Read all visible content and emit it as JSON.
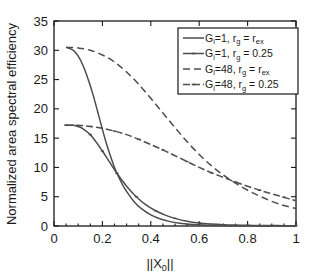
{
  "chart_data": {
    "type": "line",
    "title": "",
    "xlabel": "||X_0||",
    "xlabel_main": "||X",
    "xlabel_sub": "0",
    "xlabel_tail": "||",
    "ylabel": "Normalized area spectral efficiency",
    "xlim": [
      0,
      1
    ],
    "ylim": [
      0,
      35
    ],
    "xticks": [
      "0",
      "0.2",
      "0.4",
      "0.6",
      "0.8",
      "1"
    ],
    "xtick_values": [
      0,
      0.2,
      0.4,
      0.6,
      0.8,
      1
    ],
    "yticks": [
      "0",
      "5",
      "10",
      "15",
      "20",
      "25",
      "30",
      "35"
    ],
    "ytick_values": [
      0,
      5,
      10,
      15,
      20,
      25,
      30,
      35
    ],
    "grid": false,
    "legend_position": "upper right",
    "series": [
      {
        "name": "G_i=1, r_g = r_ex",
        "label_parts": {
          "g": "G",
          "gsub": "i",
          "mid": "=1, r",
          "rsub": "g",
          "eq": " = r",
          "tailsub": "ex"
        },
        "style": "solid",
        "marker": "none",
        "color": "#4d4d4d",
        "x": [
          0.05,
          0.08,
          0.1,
          0.12,
          0.14,
          0.16,
          0.18,
          0.2,
          0.22,
          0.25,
          0.28,
          0.3,
          0.33,
          0.36,
          0.4,
          0.44,
          0.48,
          0.52,
          0.56,
          0.6,
          0.65,
          0.7,
          0.75,
          0.8,
          0.85,
          0.9,
          0.95,
          1.0
        ],
        "y": [
          30.5,
          30.0,
          29.0,
          27.4,
          25.2,
          22.6,
          19.6,
          16.5,
          13.6,
          10.0,
          7.3,
          5.9,
          4.2,
          3.0,
          1.9,
          1.2,
          0.75,
          0.48,
          0.31,
          0.21,
          0.12,
          0.07,
          0.05,
          0.03,
          0.02,
          0.015,
          0.01,
          0.01
        ]
      },
      {
        "name": "G_i=1, r_g = 0.25",
        "label_parts": {
          "g": "G",
          "gsub": "i",
          "mid": "=1, r",
          "rsub": "g",
          "eq": " = 0.25",
          "tailsub": ""
        },
        "style": "solid",
        "marker": "tick",
        "color": "#4d4d4d",
        "x": [
          0.05,
          0.08,
          0.1,
          0.12,
          0.15,
          0.18,
          0.2,
          0.23,
          0.26,
          0.3,
          0.34,
          0.38,
          0.42,
          0.46,
          0.5,
          0.55,
          0.6,
          0.65,
          0.7,
          0.75,
          0.8,
          0.85,
          0.9,
          0.95,
          1.0
        ],
        "y": [
          17.2,
          17.2,
          17.0,
          16.6,
          15.6,
          14.0,
          12.8,
          10.9,
          9.0,
          6.8,
          5.0,
          3.6,
          2.6,
          1.85,
          1.3,
          0.8,
          0.5,
          0.33,
          0.22,
          0.16,
          0.12,
          0.09,
          0.07,
          0.06,
          0.05
        ]
      },
      {
        "name": "G_i=48, r_g = r_ex",
        "label_parts": {
          "g": "G",
          "gsub": "i",
          "mid": "=48, r",
          "rsub": "g",
          "eq": " = r",
          "tailsub": "ex"
        },
        "style": "dashed",
        "marker": "none",
        "color": "#4d4d4d",
        "x": [
          0.05,
          0.1,
          0.15,
          0.2,
          0.25,
          0.3,
          0.35,
          0.4,
          0.45,
          0.5,
          0.55,
          0.6,
          0.65,
          0.7,
          0.75,
          0.8,
          0.85,
          0.9,
          0.95,
          1.0
        ],
        "y": [
          30.5,
          30.4,
          30.0,
          29.2,
          28.0,
          26.3,
          24.2,
          21.8,
          19.3,
          16.8,
          14.4,
          12.2,
          10.3,
          8.7,
          7.3,
          6.1,
          5.1,
          4.2,
          3.5,
          3.0
        ]
      },
      {
        "name": "G_i=48, r_g = 0.25",
        "label_parts": {
          "g": "G",
          "gsub": "i",
          "mid": "=48, r",
          "rsub": "g",
          "eq": " = 0.25",
          "tailsub": ""
        },
        "style": "dashdot",
        "marker": "tick",
        "color": "#4d4d4d",
        "x": [
          0.05,
          0.1,
          0.15,
          0.2,
          0.25,
          0.3,
          0.35,
          0.4,
          0.45,
          0.5,
          0.55,
          0.6,
          0.65,
          0.7,
          0.75,
          0.8,
          0.85,
          0.9,
          0.95,
          1.0
        ],
        "y": [
          17.2,
          17.2,
          17.0,
          16.7,
          16.2,
          15.6,
          14.8,
          13.9,
          13.0,
          12.0,
          11.0,
          10.0,
          9.1,
          8.3,
          7.5,
          6.8,
          6.1,
          5.5,
          4.9,
          4.3
        ]
      }
    ]
  }
}
